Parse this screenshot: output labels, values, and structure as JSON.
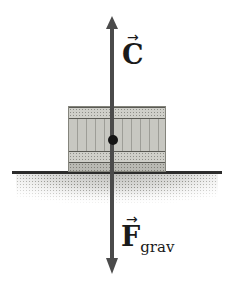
{
  "diagram": {
    "vectors": {
      "up": {
        "label": "C",
        "arrow_glyph": "→"
      },
      "down": {
        "label": "F",
        "subscript": "grav",
        "arrow_glyph": "→"
      }
    },
    "colors": {
      "background": "#ffffff",
      "arrow": "#4b4b4b",
      "label_text": "#1a1a1a",
      "crate_fill": "#c7c7c1",
      "crate_plank_line": "#9d9d97",
      "crate_band_border": "#5a5a54",
      "ground_line": "#2c2c2c",
      "ground_shadow": "#8e8e88",
      "center_dot": "#141414"
    }
  }
}
